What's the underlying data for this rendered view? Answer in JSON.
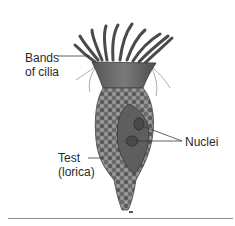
{
  "diagram": {
    "labels": {
      "bands_of_cilia": {
        "line1": "Bands",
        "line2": "of cilia"
      },
      "test_lorica": {
        "line1": "Test",
        "line2": "(lorica)"
      },
      "nuclei": "Nuclei"
    },
    "colors": {
      "cilia": "#4a4a4a",
      "body": "#6b6b6b",
      "lorica": "#7a7a7a",
      "lorica_dark": "#505050",
      "interior": "#5e5e5e",
      "leader_line": "#3a3a3a",
      "rule": "#8a8a8a"
    }
  }
}
